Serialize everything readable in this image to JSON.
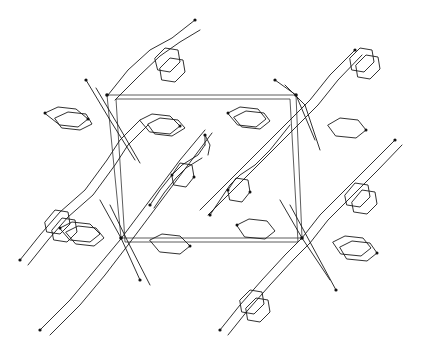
{
  "figure": {
    "type": "crystal-packing-diagram",
    "line_color": "#1a1a1a",
    "background": "#ffffff",
    "unit_cell": {
      "corners": [
        [
          107,
          95
        ],
        [
          296,
          95
        ],
        [
          302,
          238
        ],
        [
          121,
          238
        ]
      ]
    },
    "molecule_count_visible": 8
  }
}
